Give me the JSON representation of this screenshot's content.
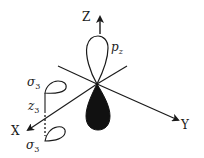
{
  "diagram": {
    "axes": {
      "z_label": "Z",
      "y_label": "Y",
      "x_label": "X"
    },
    "orbital": {
      "label_main": "p",
      "label_sub": "z",
      "upper_lobe_fill": "#ffffff",
      "lower_lobe_fill": "#111111"
    },
    "side_lobes": {
      "upper_label_main": "σ",
      "upper_label_sub": "3",
      "z_label_main": "z",
      "z_label_sub": "3",
      "lower_label_main": "σ",
      "lower_label_sub": "3"
    },
    "colors": {
      "line": "#1a1a1a",
      "background": "#ffffff"
    }
  }
}
